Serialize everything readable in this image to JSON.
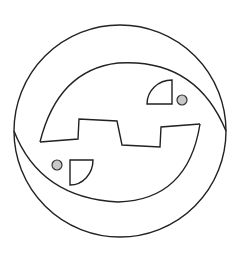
{
  "figure": {
    "width": 242,
    "height": 259,
    "background": "#ffffff",
    "stroke_color": "#222222",
    "dot_fill": "#c8c8c8",
    "outer_circle": {
      "cx": 120,
      "cy": 131,
      "r": 106
    },
    "inner_upper_arc": "M 40 142 Q 58 70 118 63 Q 196 58 226 131",
    "inner_lower_arc": "M 14 131 Q 40 198 118 202 Q 188 200 200 124",
    "zigzag": "40,142 78,139 79,119 117,121 122,145 160,147 161,127 200,124",
    "quarter_top_right": "M 172 104 L 172 80 A 25 24 0 0 0 147 104 Z",
    "quarter_bottom_left": "M 70 160 L 93 160 A 23 25 0 0 1 70 185 Z",
    "dot_top_right": {
      "cx": 182,
      "cy": 100,
      "r": 5
    },
    "dot_bottom_left": {
      "cx": 57,
      "cy": 165,
      "r": 5
    }
  }
}
